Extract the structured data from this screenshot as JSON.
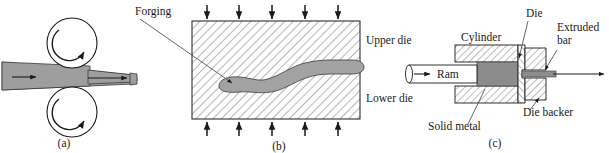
{
  "figure": {
    "colors": {
      "workpiece_fill": "#9e9e9e",
      "metal_fill": "#8c8c8c",
      "die_fill": "#ffffff",
      "hatch_line": "#555555",
      "outline": "#1a1a1a",
      "text": "#1a1a1a",
      "background": "#ffffff"
    }
  },
  "panels": [
    {
      "id": "a",
      "caption": "(a)",
      "name": "rolling",
      "labels": []
    },
    {
      "id": "b",
      "caption": "(b)",
      "name": "forging",
      "labels": [
        {
          "key": "forging",
          "text": "Forging"
        },
        {
          "key": "upper_die",
          "text": "Upper die"
        },
        {
          "key": "lower_die",
          "text": "Lower die"
        }
      ]
    },
    {
      "id": "c",
      "caption": "(c)",
      "name": "extrusion",
      "labels": [
        {
          "key": "cylinder",
          "text": "Cylinder"
        },
        {
          "key": "die",
          "text": "Die"
        },
        {
          "key": "extruded_bar_line1",
          "text": "Extruded"
        },
        {
          "key": "extruded_bar_line2",
          "text": "bar"
        },
        {
          "key": "ram",
          "text": "Ram"
        },
        {
          "key": "die_backer",
          "text": "Die backer"
        },
        {
          "key": "solid_metal",
          "text": "Solid metal"
        }
      ]
    }
  ],
  "panel_a": {
    "caption": "(a)"
  },
  "panel_b": {
    "caption": "(b)",
    "forging_label": "Forging",
    "upper_die_label": "Upper die",
    "lower_die_label": "Lower die",
    "top_arrow_count": 5,
    "bottom_arrow_count": 5
  },
  "panel_c": {
    "caption": "(c)",
    "cylinder_label": "Cylinder",
    "die_label": "Die",
    "extruded_bar_label_1": "Extruded",
    "extruded_bar_label_2": "bar",
    "ram_label": "Ram",
    "die_backer_label": "Die backer",
    "solid_metal_label": "Solid metal"
  }
}
